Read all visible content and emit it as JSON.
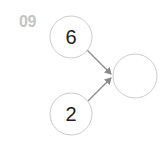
{
  "problem": {
    "number": "09"
  },
  "diagram": {
    "nodes": [
      {
        "id": "top",
        "value": "6",
        "cx": 71,
        "cy": 37,
        "r": 21
      },
      {
        "id": "bottom",
        "value": "2",
        "cx": 71,
        "cy": 114,
        "r": 21
      },
      {
        "id": "result",
        "value": "",
        "cx": 135,
        "cy": 76,
        "r": 22
      }
    ],
    "edges": [
      {
        "from": "top",
        "to": "result"
      },
      {
        "from": "bottom",
        "to": "result"
      }
    ],
    "colors": {
      "circle_stroke": "#cccccc",
      "arrow": "#8a8a8a",
      "label": "#c4c4c4",
      "text": "#222222"
    }
  }
}
